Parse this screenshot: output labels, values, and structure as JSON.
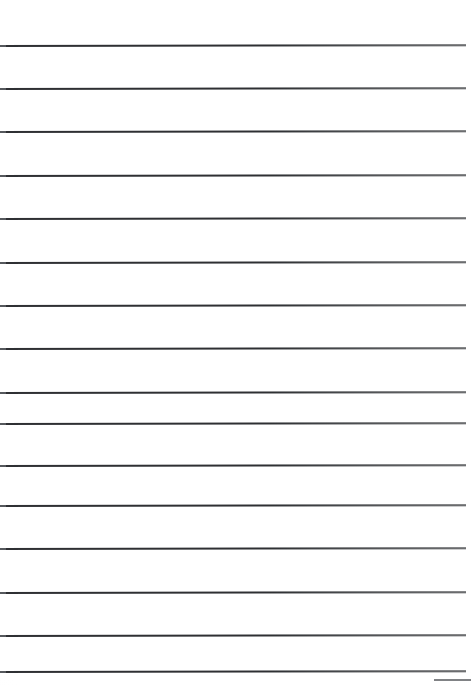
{
  "document": {
    "kind": "scanned-blank-ruled-paper",
    "has_text": false,
    "background_color": "#ffffff",
    "page": {
      "width": 471,
      "height": 685
    }
  },
  "ruling": {
    "line_color": "#2e3033",
    "line_thickness": 2,
    "line_start_x": 0,
    "line_end_x": 466,
    "line_count": 16,
    "spacing": 43.3,
    "first_line_y": 45,
    "skew_degrees": -0.1,
    "lines_y": [
      45,
      88,
      131,
      175,
      218,
      262,
      305,
      348,
      392,
      423,
      465,
      505,
      548,
      592,
      635,
      671
    ]
  },
  "artifacts": {
    "bottom_right_stub": {
      "x": 434,
      "y": 679,
      "width": 37,
      "color": "#55585c"
    }
  }
}
